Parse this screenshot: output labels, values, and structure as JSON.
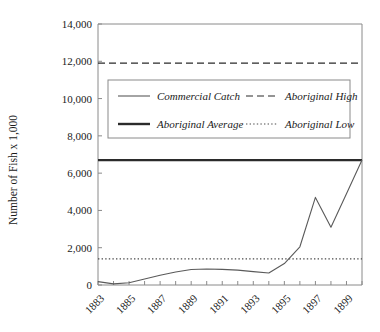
{
  "chart_data": {
    "type": "line",
    "title": "",
    "xlabel": "",
    "ylabel": "Number of Fish x 1,000",
    "xlim": [
      1883,
      1900
    ],
    "ylim": [
      0,
      14000
    ],
    "grid": false,
    "legend_position": "upper-left-inside",
    "x": [
      1883,
      1884,
      1885,
      1886,
      1887,
      1888,
      1889,
      1890,
      1891,
      1892,
      1893,
      1894,
      1895,
      1896,
      1897,
      1898,
      1899,
      1900
    ],
    "ytick_labels": [
      "0",
      "2,000",
      "4,000",
      "6,000",
      "8,000",
      "10,000",
      "12,000",
      "14,000"
    ],
    "ytick_values": [
      0,
      2000,
      4000,
      6000,
      8000,
      10000,
      12000,
      14000
    ],
    "xtick_labels": [
      "1883",
      "1885",
      "1887",
      "1889",
      "1891",
      "1893",
      "1895",
      "1897",
      "1899"
    ],
    "xtick_values": [
      1883,
      1885,
      1887,
      1889,
      1891,
      1893,
      1895,
      1897,
      1899
    ],
    "xtick_minor_values": [
      1884,
      1886,
      1888,
      1890,
      1892,
      1894,
      1896,
      1898,
      1900
    ],
    "series": [
      {
        "name": "Commercial Catch",
        "style": "solid-thin",
        "color": "#5a5a5a",
        "values": [
          180,
          60,
          120,
          320,
          520,
          700,
          830,
          860,
          840,
          800,
          720,
          640,
          1150,
          2050,
          4700,
          3100,
          4900,
          6700
        ]
      },
      {
        "name": "Aboriginal Average",
        "style": "solid-thick",
        "color": "#2b2b2b",
        "constant": 6700
      },
      {
        "name": "Aboriginal High",
        "style": "dashed",
        "color": "#2b2b2b",
        "constant": 11900
      },
      {
        "name": "Aboriginal Low",
        "style": "dotted",
        "color": "#4a4a4a",
        "constant": 1400
      }
    ],
    "legend": [
      {
        "label": "Commercial Catch",
        "style": "solid-thin"
      },
      {
        "label": "Aboriginal High",
        "style": "dashed"
      },
      {
        "label": "Aboriginal Average",
        "style": "solid-thick"
      },
      {
        "label": "Aboriginal Low",
        "style": "dotted"
      }
    ]
  }
}
